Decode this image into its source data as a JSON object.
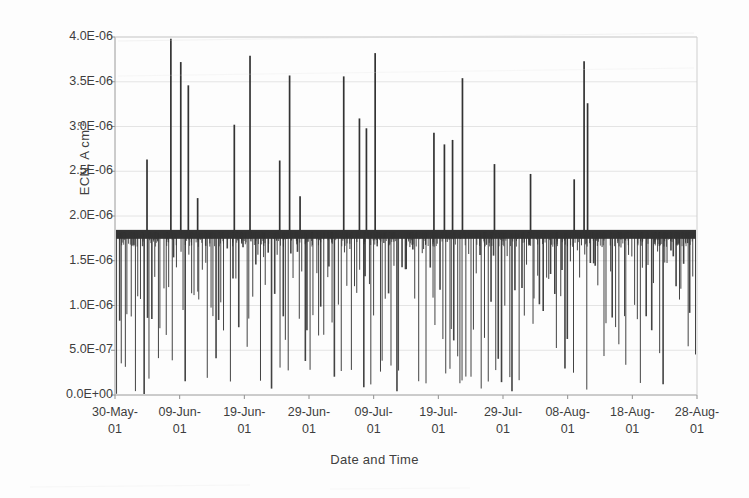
{
  "chart_data": {
    "type": "line",
    "title": "",
    "xlabel": "Date and Time",
    "ylabel": "ECN, A cm",
    "ylabel_sup": "-2",
    "ylim": [
      0,
      4e-06
    ],
    "ytick_labels": [
      "4.0E-06",
      "3.5E-06",
      "3.0E-06",
      "2.5E-06",
      "2.0E-06",
      "1.5E-06",
      "1.0E-06",
      "5.0E-07",
      "0.0E+00"
    ],
    "ytick_values": [
      4e-06,
      3.5e-06,
      3e-06,
      2.5e-06,
      2e-06,
      1.5e-06,
      1e-06,
      5e-07,
      0.0
    ],
    "xtick_labels": [
      "30-May-01",
      "09-Jun-01",
      "19-Jun-01",
      "29-Jun-01",
      "09-Jul-01",
      "19-Jul-01",
      "29-Jul-01",
      "08-Aug-01",
      "18-Aug-01",
      "28-Aug-01"
    ],
    "xtick_line1": [
      "30-May-",
      "09-Jun-",
      "19-Jun-",
      "29-Jun-",
      "09-Jul-",
      "19-Jul-",
      "29-Jul-",
      "08-Aug-",
      "18-Aug-",
      "28-Aug-"
    ],
    "xtick_line2": [
      "01",
      "01",
      "01",
      "01",
      "01",
      "01",
      "01",
      "01",
      "01",
      "01"
    ],
    "xlim_labels": [
      "30-May-01",
      "28-Aug-01"
    ],
    "grid": true,
    "grid_axis": "y",
    "legend": "none",
    "series_name": "ECN",
    "line_color": "#333333",
    "baseline_value": 1.8e-06,
    "up_spikes": [
      {
        "x": 0.055,
        "y": 2.63e-06
      },
      {
        "x": 0.096,
        "y": 3.98e-06
      },
      {
        "x": 0.113,
        "y": 3.72e-06
      },
      {
        "x": 0.126,
        "y": 3.46e-06
      },
      {
        "x": 0.142,
        "y": 2.2e-06
      },
      {
        "x": 0.205,
        "y": 3.02e-06
      },
      {
        "x": 0.232,
        "y": 3.79e-06
      },
      {
        "x": 0.283,
        "y": 2.62e-06
      },
      {
        "x": 0.3,
        "y": 3.57e-06
      },
      {
        "x": 0.318,
        "y": 2.22e-06
      },
      {
        "x": 0.393,
        "y": 3.56e-06
      },
      {
        "x": 0.42,
        "y": 3.09e-06
      },
      {
        "x": 0.432,
        "y": 2.98e-06
      },
      {
        "x": 0.447,
        "y": 3.82e-06
      },
      {
        "x": 0.548,
        "y": 2.93e-06
      },
      {
        "x": 0.566,
        "y": 2.8e-06
      },
      {
        "x": 0.58,
        "y": 2.85e-06
      },
      {
        "x": 0.597,
        "y": 3.54e-06
      },
      {
        "x": 0.652,
        "y": 2.58e-06
      },
      {
        "x": 0.714,
        "y": 2.47e-06
      },
      {
        "x": 0.789,
        "y": 2.41e-06
      },
      {
        "x": 0.806,
        "y": 3.73e-06
      },
      {
        "x": 0.812,
        "y": 3.26e-06
      }
    ],
    "down_spike_count": 210
  }
}
